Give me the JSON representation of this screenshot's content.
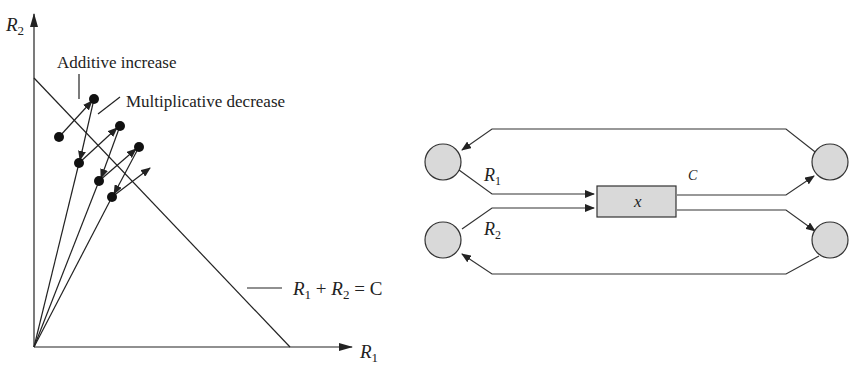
{
  "left_figure": {
    "y_axis_label": "R",
    "y_axis_sub": "2",
    "x_axis_label": "R",
    "x_axis_sub": "1",
    "annotation_additive": "Additive increase",
    "annotation_multiplicative": "Multiplicative decrease",
    "constraint_r1": "R",
    "constraint_sub1": "1",
    "constraint_plus": " + ",
    "constraint_r2": "R",
    "constraint_sub2": "2",
    "constraint_eq": " = C"
  },
  "right_figure": {
    "flow1_label": "R",
    "flow1_sub": "1",
    "flow2_label": "R",
    "flow2_sub": "2",
    "capacity_label": "C",
    "bottleneck_label": "x",
    "node_fill": "#d9d9d9",
    "box_fill": "#d9d9d9"
  }
}
